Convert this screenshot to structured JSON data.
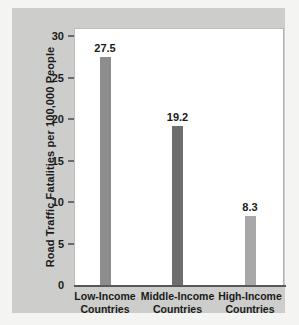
{
  "chart_data": {
    "type": "bar",
    "title": "",
    "subtitle": "",
    "xlabel": "",
    "ylabel": "Road Traffic Fatalities per 100,000 People",
    "categories": [
      "Low-Income\nCountries",
      "Middle-Income\nCountries",
      "High-Income\nCountries"
    ],
    "category_lines": [
      [
        "Low-Income",
        "Countries"
      ],
      [
        "Middle-Income",
        "Countries"
      ],
      [
        "High-Income",
        "Countries"
      ]
    ],
    "values": [
      27.5,
      19.2,
      8.3
    ],
    "value_labels": [
      "27.5",
      "19.2",
      "8.3"
    ],
    "ylim": [
      0,
      30
    ],
    "yticks": [
      0,
      5,
      10,
      15,
      20,
      25,
      30
    ],
    "ytick_labels": [
      "0",
      "5",
      "10",
      "15",
      "20",
      "25",
      "30"
    ],
    "grid": false,
    "legend": null,
    "bar_colors": [
      "#8d8d8d",
      "#6e6e6e",
      "#a8a8a8"
    ],
    "colors": {
      "figure_background": "#f4f4f2",
      "panel_background": "#cdcdcb",
      "plot_background": "#ffffff",
      "axis": "#58585a",
      "text": "#1a1a1a"
    }
  }
}
